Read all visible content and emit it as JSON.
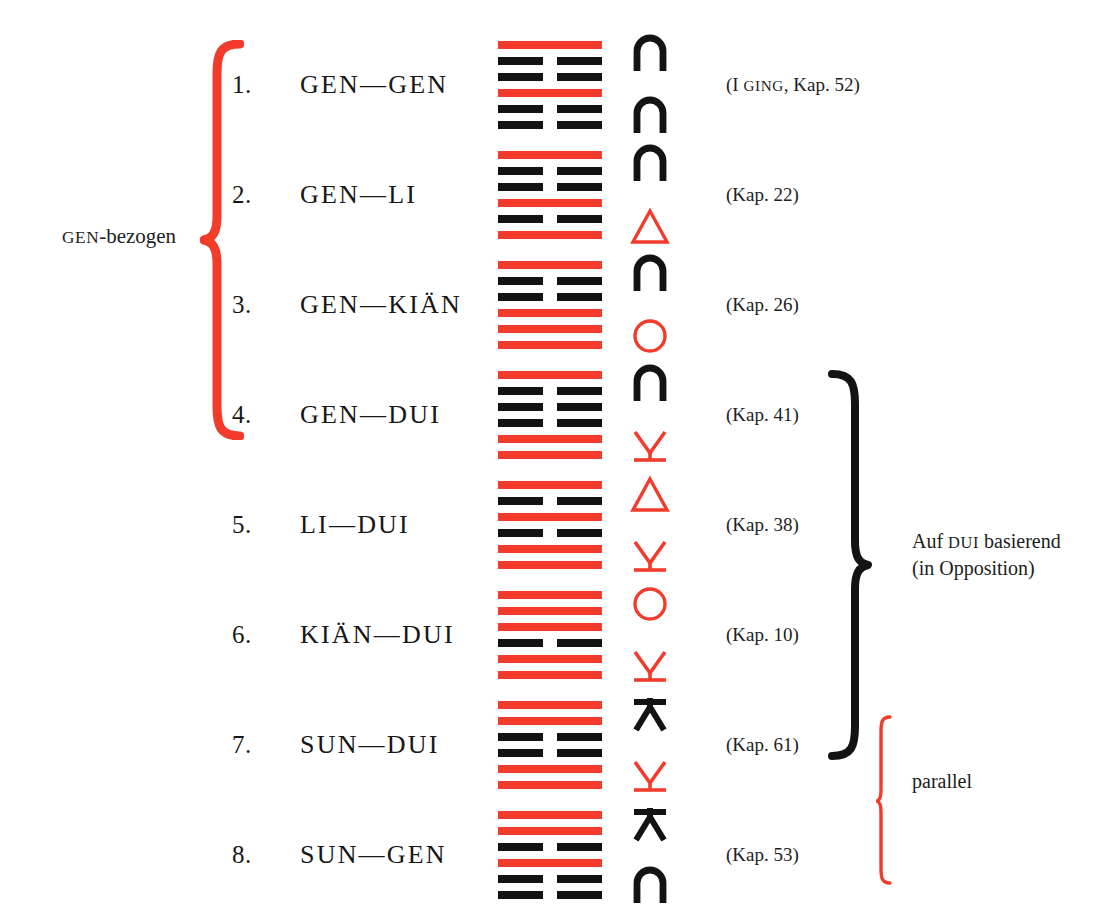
{
  "diagram": {
    "accent_red": "#F23B2B",
    "ink_black": "#131313"
  },
  "rows": [
    {
      "num": "1.",
      "label": "GEN—GEN",
      "chapter_prefix": "(I ",
      "chapter_smallcaps": "GING",
      "chapter_suffix": ", Kap. 52)",
      "chapter_full": "(I GING, Kap. 52)",
      "lines": [
        {
          "type": "solid",
          "color": "red"
        },
        {
          "type": "broken",
          "color": "black"
        },
        {
          "type": "broken",
          "color": "black"
        },
        {
          "type": "solid",
          "color": "red"
        },
        {
          "type": "broken",
          "color": "black"
        },
        {
          "type": "broken",
          "color": "black"
        }
      ],
      "glyph_top": {
        "name": "gen-arch-icon",
        "shape": "arch",
        "color": "black"
      },
      "glyph_bottom": {
        "name": "gen-arch-icon",
        "shape": "arch",
        "color": "black"
      }
    },
    {
      "num": "2.",
      "label": "GEN—LI",
      "chapter_prefix": "",
      "chapter_smallcaps": "",
      "chapter_suffix": "(Kap. 22)",
      "chapter_full": "(Kap. 22)",
      "lines": [
        {
          "type": "solid",
          "color": "red"
        },
        {
          "type": "broken",
          "color": "black"
        },
        {
          "type": "broken",
          "color": "black"
        },
        {
          "type": "solid",
          "color": "red"
        },
        {
          "type": "broken",
          "color": "black"
        },
        {
          "type": "solid",
          "color": "red"
        }
      ],
      "glyph_top": {
        "name": "gen-arch-icon",
        "shape": "arch",
        "color": "black"
      },
      "glyph_bottom": {
        "name": "li-triangle-icon",
        "shape": "triangle",
        "color": "red"
      }
    },
    {
      "num": "3.",
      "label": "GEN—KIÄN",
      "chapter_prefix": "",
      "chapter_smallcaps": "",
      "chapter_suffix": "(Kap. 26)",
      "chapter_full": "(Kap. 26)",
      "lines": [
        {
          "type": "solid",
          "color": "red"
        },
        {
          "type": "broken",
          "color": "black"
        },
        {
          "type": "broken",
          "color": "black"
        },
        {
          "type": "solid",
          "color": "red"
        },
        {
          "type": "solid",
          "color": "red"
        },
        {
          "type": "solid",
          "color": "red"
        }
      ],
      "glyph_top": {
        "name": "gen-arch-icon",
        "shape": "arch",
        "color": "black"
      },
      "glyph_bottom": {
        "name": "kian-circle-icon",
        "shape": "circle",
        "color": "red"
      }
    },
    {
      "num": "4.",
      "label": "GEN—DUI",
      "chapter_prefix": "",
      "chapter_smallcaps": "",
      "chapter_suffix": "(Kap. 41)",
      "chapter_full": "(Kap. 41)",
      "lines": [
        {
          "type": "solid",
          "color": "red"
        },
        {
          "type": "broken",
          "color": "black"
        },
        {
          "type": "broken",
          "color": "black"
        },
        {
          "type": "broken",
          "color": "black"
        },
        {
          "type": "solid",
          "color": "red"
        },
        {
          "type": "solid",
          "color": "red"
        }
      ],
      "glyph_top": {
        "name": "gen-arch-icon",
        "shape": "arch",
        "color": "black"
      },
      "glyph_bottom": {
        "name": "dui-down-icon",
        "shape": "dui-down",
        "color": "red"
      }
    },
    {
      "num": "5.",
      "label": "LI—DUI",
      "chapter_prefix": "",
      "chapter_smallcaps": "",
      "chapter_suffix": "(Kap. 38)",
      "chapter_full": "(Kap. 38)",
      "lines": [
        {
          "type": "solid",
          "color": "red"
        },
        {
          "type": "broken",
          "color": "black"
        },
        {
          "type": "solid",
          "color": "red"
        },
        {
          "type": "broken",
          "color": "black"
        },
        {
          "type": "solid",
          "color": "red"
        },
        {
          "type": "solid",
          "color": "red"
        }
      ],
      "glyph_top": {
        "name": "li-triangle-icon",
        "shape": "triangle",
        "color": "red"
      },
      "glyph_bottom": {
        "name": "dui-down-icon",
        "shape": "dui-down",
        "color": "red"
      }
    },
    {
      "num": "6.",
      "label": "KIÄN—DUI",
      "chapter_prefix": "",
      "chapter_smallcaps": "",
      "chapter_suffix": "(Kap. 10)",
      "chapter_full": "(Kap. 10)",
      "lines": [
        {
          "type": "solid",
          "color": "red"
        },
        {
          "type": "solid",
          "color": "red"
        },
        {
          "type": "solid",
          "color": "red"
        },
        {
          "type": "broken",
          "color": "black"
        },
        {
          "type": "solid",
          "color": "red"
        },
        {
          "type": "solid",
          "color": "red"
        }
      ],
      "glyph_top": {
        "name": "kian-circle-icon",
        "shape": "circle",
        "color": "red"
      },
      "glyph_bottom": {
        "name": "dui-down-icon",
        "shape": "dui-down",
        "color": "red"
      }
    },
    {
      "num": "7.",
      "label": "SUN—DUI",
      "chapter_prefix": "",
      "chapter_smallcaps": "",
      "chapter_suffix": "(Kap. 61)",
      "chapter_full": "(Kap. 61)",
      "lines": [
        {
          "type": "solid",
          "color": "red"
        },
        {
          "type": "solid",
          "color": "red"
        },
        {
          "type": "broken",
          "color": "black"
        },
        {
          "type": "broken",
          "color": "black"
        },
        {
          "type": "solid",
          "color": "red"
        },
        {
          "type": "solid",
          "color": "red"
        }
      ],
      "glyph_top": {
        "name": "sun-up-icon",
        "shape": "sun-up",
        "color": "black"
      },
      "glyph_bottom": {
        "name": "dui-down-icon",
        "shape": "dui-down",
        "color": "red"
      }
    },
    {
      "num": "8.",
      "label": "SUN—GEN",
      "chapter_prefix": "",
      "chapter_smallcaps": "",
      "chapter_suffix": "(Kap. 53)",
      "chapter_full": "(Kap. 53)",
      "lines": [
        {
          "type": "solid",
          "color": "red"
        },
        {
          "type": "solid",
          "color": "red"
        },
        {
          "type": "broken",
          "color": "black"
        },
        {
          "type": "solid",
          "color": "red"
        },
        {
          "type": "broken",
          "color": "black"
        },
        {
          "type": "broken",
          "color": "black"
        }
      ],
      "glyph_top": {
        "name": "sun-up-icon",
        "shape": "sun-up",
        "color": "black"
      },
      "glyph_bottom": {
        "name": "gen-arch-icon",
        "shape": "arch",
        "color": "black"
      }
    }
  ],
  "annotations": {
    "gen_bezogen": {
      "smallcaps": "GEN",
      "rest": "-bezogen",
      "full": "GEN-bezogen",
      "brace_color": "#F23B2B",
      "covers_rows": [
        1,
        2,
        3,
        4
      ]
    },
    "dui_basierend": {
      "line1_prefix": "Auf ",
      "line1_smallcaps": "DUI",
      "line1_suffix": " basierend",
      "line1_full": "Auf DUI basierend",
      "line2": "(in Opposition)",
      "brace_color": "#131313",
      "covers_rows": [
        4,
        5,
        6,
        7
      ]
    },
    "parallel": {
      "label": "parallel",
      "brace_color": "#F23B2B",
      "covers_rows": [
        7,
        8
      ]
    }
  }
}
